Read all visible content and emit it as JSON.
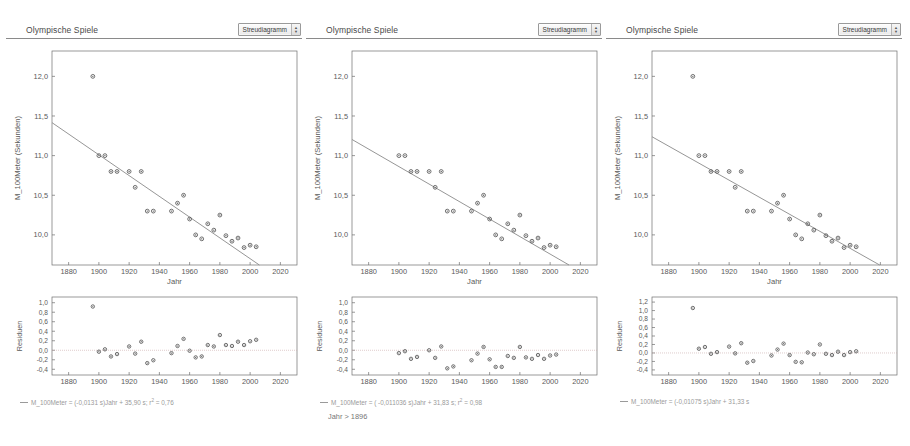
{
  "panels": [
    {
      "id": "panel-1",
      "title": "Olympische Spiele",
      "chooser": {
        "label": "Streudiagramm",
        "icon": "chevron-updown-icon"
      },
      "scatter": {
        "ylabel": "M_100Meter (Sekunden)",
        "xlabel": "Jahr",
        "yticks": [
          "12,0",
          "11,5",
          "11,0",
          "10,5",
          "10,0"
        ],
        "ytickvals": [
          12.0,
          11.5,
          11.0,
          10.5,
          10.0
        ],
        "xticks": [
          "1880",
          "1900",
          "1920",
          "1940",
          "1960",
          "1980",
          "2000",
          "2020"
        ],
        "xtickvals": [
          1880,
          1900,
          1920,
          1940,
          1960,
          1980,
          2000,
          2020
        ],
        "xlim": [
          1869,
          2031
        ],
        "ylim": [
          9.62,
          12.32
        ],
        "fit": {
          "slope": -0.0131,
          "intercept": 35.9
        }
      },
      "residual": {
        "ylabel": "Residuen",
        "yticks": [
          "1,0",
          "0,8",
          "0,6",
          "0,4",
          "0,2",
          "0,0",
          "-0,2",
          "-0,4"
        ],
        "ytickvals": [
          1.0,
          0.8,
          0.6,
          0.4,
          0.2,
          0.0,
          -0.2,
          -0.4
        ],
        "xticks": [
          "1880",
          "1900",
          "1920",
          "1940",
          "1960",
          "1980",
          "2000",
          "2020"
        ],
        "xtickvals": [
          1880,
          1900,
          1920,
          1940,
          1960,
          1980,
          2000,
          2020
        ],
        "xlim": [
          1869,
          2031
        ],
        "ylim": [
          -0.52,
          1.12
        ]
      },
      "legend": "M_100Meter = (-0,0131 s)Jahr + 35,90 s; r² = 0,76",
      "filter": null
    },
    {
      "id": "panel-2",
      "title": "Olympische Spiele",
      "chooser": {
        "label": "Streudiagramm",
        "icon": "chevron-updown-icon"
      },
      "scatter": {
        "ylabel": "M_100Meter (Sekunden)",
        "xlabel": "Jahr",
        "yticks": [
          "12,0",
          "11,5",
          "11,0",
          "10,5",
          "10,0"
        ],
        "ytickvals": [
          12.0,
          11.5,
          11.0,
          10.5,
          10.0
        ],
        "xticks": [
          "1880",
          "1900",
          "1920",
          "1940",
          "1960",
          "1980",
          "2000",
          "2020"
        ],
        "xtickvals": [
          1880,
          1900,
          1920,
          1940,
          1960,
          1980,
          2000,
          2020
        ],
        "xlim": [
          1869,
          2031
        ],
        "ylim": [
          9.62,
          12.32
        ],
        "fit": {
          "slope": -0.011036,
          "intercept": 31.83
        }
      },
      "residual": {
        "ylabel": "Residuen",
        "yticks": [
          "1,0",
          "0,8",
          "0,6",
          "0,4",
          "0,2",
          "0,0",
          "-0,2",
          "-0,4"
        ],
        "ytickvals": [
          1.0,
          0.8,
          0.6,
          0.4,
          0.2,
          0.0,
          -0.2,
          -0.4
        ],
        "xticks": [
          "1880",
          "1900",
          "1920",
          "1940",
          "1960",
          "1980",
          "2000",
          "2020"
        ],
        "xtickvals": [
          1880,
          1900,
          1920,
          1940,
          1960,
          1980,
          2000,
          2020
        ],
        "xlim": [
          1869,
          2031
        ],
        "ylim": [
          -0.52,
          1.12
        ]
      },
      "legend": "M_100Meter = ( -0,011036 s)Jahr + 31,83 s; r² = 0,98",
      "filter": "Jahr > 1896"
    },
    {
      "id": "panel-3",
      "title": "Olympische Spiele",
      "chooser": {
        "label": "Streudiagramm",
        "icon": "chevron-updown-icon"
      },
      "scatter": {
        "ylabel": "M_100Meter (Sekunden)",
        "xlabel": "Jahr",
        "yticks": [
          "12,0",
          "11,5",
          "11,0",
          "10,5",
          "10,0"
        ],
        "ytickvals": [
          12.0,
          11.5,
          11.0,
          10.5,
          10.0
        ],
        "xticks": [
          "1880",
          "1900",
          "1920",
          "1940",
          "1960",
          "1980",
          "2000",
          "2020"
        ],
        "xtickvals": [
          1880,
          1900,
          1920,
          1940,
          1960,
          1980,
          2000,
          2020
        ],
        "xlim": [
          1869,
          2031
        ],
        "ylim": [
          9.62,
          12.32
        ],
        "fit": {
          "slope": -0.01075,
          "intercept": 31.33
        }
      },
      "residual": {
        "ylabel": "Residuen",
        "yticks": [
          "1,2",
          "1,0",
          "0,8",
          "0,6",
          "0,4",
          "0,2",
          "0,0",
          "-0,2",
          "-0,4"
        ],
        "ytickvals": [
          1.2,
          1.0,
          0.8,
          0.6,
          0.4,
          0.2,
          0.0,
          -0.2,
          -0.4
        ],
        "xticks": [
          "1880",
          "1900",
          "1920",
          "1940",
          "1960",
          "1980",
          "2000",
          "2020"
        ],
        "xtickvals": [
          1880,
          1900,
          1920,
          1940,
          1960,
          1980,
          2000,
          2020
        ],
        "xlim": [
          1869,
          2031
        ],
        "ylim": [
          -0.52,
          1.32
        ]
      },
      "legend": "M_100Meter = (-0,01075 s)Jahr + 31,33 s",
      "filter": null
    }
  ],
  "colors": {
    "point": "#5f5f5f",
    "line": "#8a8a8a",
    "axis": "#6e6e6e",
    "text": "#5a5a5a",
    "legend_text": "#9a9a9a",
    "zero_line": "#c9a9a9"
  },
  "chart_data": {
    "type": "scatter",
    "xlabel": "Jahr",
    "ylabel": "M_100Meter (Sekunden)",
    "xlim": [
      1869,
      2031
    ],
    "ylim": [
      9.62,
      12.32
    ],
    "grid": false,
    "legend_position": "below",
    "x": [
      1896,
      1900,
      1904,
      1908,
      1912,
      1920,
      1924,
      1928,
      1932,
      1936,
      1948,
      1952,
      1956,
      1960,
      1964,
      1968,
      1972,
      1976,
      1980,
      1984,
      1988,
      1992,
      1996,
      2000,
      2004
    ],
    "series": [
      {
        "name": "M_100Meter",
        "values": [
          12.0,
          11.0,
          11.0,
          10.8,
          10.8,
          10.8,
          10.6,
          10.8,
          10.3,
          10.3,
          10.3,
          10.4,
          10.5,
          10.2,
          10.0,
          9.95,
          10.14,
          10.06,
          10.25,
          9.99,
          9.92,
          9.96,
          9.84,
          9.87,
          9.85
        ]
      }
    ],
    "panels": [
      {
        "name": "Alle Daten",
        "fit": {
          "slope": -0.0131,
          "intercept": 35.9,
          "r2": 0.76
        },
        "equation": "M_100Meter = (-0,0131 s)Jahr + 35,90 s; r² = 0,76",
        "residual_label": "Residuen",
        "residuals": [
          0.92,
          -0.03,
          0.02,
          -0.13,
          -0.08,
          0.08,
          -0.07,
          0.18,
          -0.27,
          -0.21,
          -0.06,
          0.09,
          0.24,
          -0.01,
          -0.15,
          -0.13,
          0.11,
          0.08,
          0.32,
          0.11,
          0.09,
          0.18,
          0.11,
          0.19,
          0.22
        ]
      },
      {
        "name": "Jahr > 1896",
        "filter": "Jahr > 1896",
        "fit": {
          "slope": -0.011036,
          "intercept": 31.83,
          "r2": 0.98
        },
        "equation": "M_100Meter = ( -0,011036 s)Jahr + 31,83 s; r² = 0,98",
        "residual_label": "Residuen",
        "residuals": [
          null,
          -0.06,
          -0.02,
          -0.18,
          -0.14,
          0.0,
          -0.16,
          0.08,
          -0.38,
          -0.34,
          -0.21,
          -0.07,
          0.07,
          -0.19,
          -0.35,
          -0.35,
          -0.12,
          -0.16,
          0.07,
          -0.15,
          -0.18,
          -0.1,
          -0.18,
          -0.11,
          -0.09
        ]
      },
      {
        "name": "Alle Daten (alternative Anpassung)",
        "fit": {
          "slope": -0.01075,
          "intercept": 31.33
        },
        "equation": "M_100Meter = (-0,01075 s)Jahr + 31,33 s",
        "residual_label": "Residuen",
        "residuals": [
          1.06,
          0.1,
          0.14,
          -0.02,
          0.02,
          0.15,
          -0.01,
          0.23,
          -0.23,
          -0.19,
          -0.06,
          0.08,
          0.22,
          -0.05,
          -0.21,
          -0.22,
          0.01,
          -0.03,
          0.2,
          -0.02,
          -0.05,
          0.03,
          -0.05,
          0.02,
          0.04
        ]
      }
    ]
  }
}
